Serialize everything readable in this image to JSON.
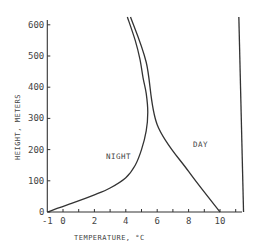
{
  "chart_data": {
    "type": "line",
    "title": "",
    "xlabel": "TEMPERATURE, °C",
    "ylabel": "HEIGHT, METERS",
    "xlim": [
      -1,
      11.5
    ],
    "ylim": [
      0,
      600
    ],
    "grid": false,
    "legend": "inline labels",
    "x_ticks": [
      -1,
      0,
      2,
      4,
      6,
      8,
      10
    ],
    "x_tick_labels": [
      "-1",
      "0",
      "2",
      "4",
      "6",
      "8",
      "10"
    ],
    "x_minor_ticks": [
      1,
      3,
      5,
      7,
      9,
      11
    ],
    "y_ticks": [
      0,
      100,
      200,
      300,
      400,
      500,
      600
    ],
    "y_tick_labels": [
      "0",
      "100",
      "200",
      "300",
      "400",
      "500",
      "600"
    ],
    "series": [
      {
        "name": "NIGHT",
        "points": [
          {
            "x": -1.0,
            "y": 0
          },
          {
            "x": 0.4,
            "y": 25
          },
          {
            "x": 2.0,
            "y": 55
          },
          {
            "x": 3.0,
            "y": 77
          },
          {
            "x": 4.0,
            "y": 110
          },
          {
            "x": 4.6,
            "y": 150
          },
          {
            "x": 5.0,
            "y": 200
          },
          {
            "x": 5.3,
            "y": 260
          },
          {
            "x": 5.4,
            "y": 320
          },
          {
            "x": 5.3,
            "y": 380
          },
          {
            "x": 5.1,
            "y": 430
          },
          {
            "x": 4.9,
            "y": 490
          },
          {
            "x": 4.6,
            "y": 550
          },
          {
            "x": 4.1,
            "y": 625
          }
        ]
      },
      {
        "name": "DAY",
        "points": [
          {
            "x": 10.0,
            "y": 0
          },
          {
            "x": 8.0,
            "y": 130
          },
          {
            "x": 6.0,
            "y": 280
          },
          {
            "x": 5.3,
            "y": 480
          },
          {
            "x": 4.3,
            "y": 625
          }
        ]
      },
      {
        "name": "right boundary",
        "points": [
          {
            "x": 11.5,
            "y": 0
          },
          {
            "x": 11.2,
            "y": 625
          }
        ]
      }
    ],
    "annotations": [
      {
        "text": "NIGHT",
        "x": 2.3,
        "y": 175
      },
      {
        "text": "DAY",
        "x": 8.2,
        "y": 305
      }
    ]
  },
  "labels": {
    "xlabel": "TEMPERATURE,  °C",
    "ylabel": "HEIGHT, METERS",
    "night": "NIGHT",
    "day": "DAY"
  }
}
